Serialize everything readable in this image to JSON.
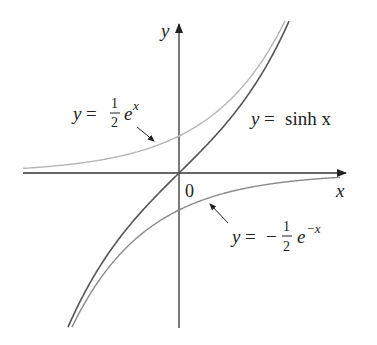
{
  "chart_data": {
    "type": "line",
    "title": "",
    "xlabel": "x",
    "ylabel": "y",
    "origin_label": "0",
    "xlim": [
      -2.05,
      2.1
    ],
    "ylim": [
      -2.1,
      2.0
    ],
    "grid": false,
    "legend": "none (inline labels)",
    "series": [
      {
        "name": "y = sinh x",
        "expression": "sinh(x)",
        "color": "#555555",
        "label": {
          "lhs": "y",
          "eq": "=",
          "rhs": "sinh x"
        }
      },
      {
        "name": "y = (1/2) e^x",
        "expression": "0.5*exp(x)",
        "color": "#b5b5b5",
        "label": {
          "lhs": "y",
          "eq": "=",
          "num": "1",
          "den": "2",
          "base": "e",
          "exp": "x"
        }
      },
      {
        "name": "y = -(1/2) e^(-x)",
        "expression": "-0.5*exp(-x)",
        "color": "#8a8a8a",
        "label": {
          "lhs": "y",
          "eq": "=",
          "sign": "−",
          "num": "1",
          "den": "2",
          "base": "e",
          "exp": "−x"
        }
      }
    ],
    "annotations": [
      "arrow pointing to y = (1/2)e^x",
      "arrow pointing to y = -(1/2)e^(-x)"
    ],
    "sample_points": {
      "x": [
        -1.5,
        -1,
        -0.5,
        0,
        0.5,
        1,
        1.5
      ],
      "sinh": [
        -2.13,
        -1.18,
        -0.52,
        0,
        0.52,
        1.18,
        2.13
      ],
      "half_exp": [
        0.11,
        0.18,
        0.3,
        0.5,
        0.82,
        1.36,
        2.24
      ],
      "neg_half_exp_neg": [
        -2.24,
        -1.36,
        -0.82,
        -0.5,
        -0.3,
        -0.18,
        -0.11
      ]
    }
  }
}
